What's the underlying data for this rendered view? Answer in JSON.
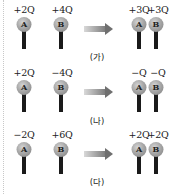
{
  "diagrams": [
    {
      "caption": "(가)",
      "before": {
        "A": "+2Q",
        "B": "+4Q"
      },
      "after": {
        "A": "+3Q",
        "B": "+3Q"
      }
    },
    {
      "caption": "(나)",
      "before": {
        "A": "+2Q",
        "B": "−4Q"
      },
      "after": {
        "A": "−Q",
        "B": "−Q"
      }
    },
    {
      "caption": "(다)",
      "before": {
        "A": "−2Q",
        "B": "+6Q"
      },
      "after": {
        "A": "+2Q",
        "B": "+2Q"
      }
    }
  ],
  "labels": {
    "sphere_a": "A",
    "sphere_b": "B"
  },
  "colors": {
    "sphere": "#a8a8a8",
    "stem": "#1a1a1a",
    "arrow": "#7a7a7a"
  }
}
